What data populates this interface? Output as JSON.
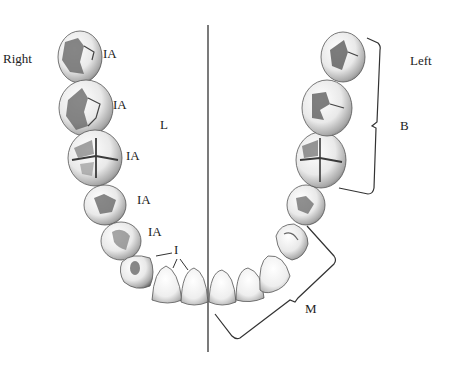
{
  "figure": {
    "type": "mandibular dental arch, occlusal view",
    "background": "#ffffff",
    "ink_color": "#222222"
  },
  "labels": {
    "right": "Right",
    "left": "Left",
    "lingual": "L",
    "buccal_bracket": "B",
    "mesial_bracket": "M",
    "incisors": "I",
    "ia": [
      "IA",
      "IA",
      "IA",
      "IA",
      "IA"
    ]
  },
  "midline": {
    "x": 208,
    "y_top": 25,
    "y_bottom": 352
  },
  "teeth": {
    "right_side": [
      {
        "name": "right-third-molar",
        "cx": 80,
        "cy": 57,
        "rx": 22,
        "ry": 26
      },
      {
        "name": "right-second-molar",
        "cx": 86,
        "cy": 108,
        "rx": 27,
        "ry": 28
      },
      {
        "name": "right-first-molar",
        "cx": 95,
        "cy": 158,
        "rx": 27,
        "ry": 28
      },
      {
        "name": "right-second-premolar",
        "cx": 105,
        "cy": 205,
        "rx": 21,
        "ry": 20
      },
      {
        "name": "right-first-premolar",
        "cx": 121,
        "cy": 241,
        "rx": 20,
        "ry": 19
      },
      {
        "name": "right-canine",
        "cx": 137,
        "cy": 273,
        "rx": 17,
        "ry": 19
      },
      {
        "name": "right-lateral-incisor",
        "cx": 167,
        "cy": 285,
        "rx": 15,
        "ry": 19
      },
      {
        "name": "right-central-incisor",
        "cx": 194,
        "cy": 288,
        "rx": 13,
        "ry": 19
      }
    ],
    "left_side": [
      {
        "name": "left-central-incisor",
        "cx": 222,
        "cy": 289,
        "rx": 13,
        "ry": 19
      },
      {
        "name": "left-lateral-incisor",
        "cx": 250,
        "cy": 284,
        "rx": 14,
        "ry": 19
      },
      {
        "name": "left-canine",
        "cx": 274,
        "cy": 269,
        "rx": 15,
        "ry": 20
      },
      {
        "name": "left-first-premolar",
        "cx": 292,
        "cy": 242,
        "rx": 18,
        "ry": 19
      },
      {
        "name": "left-second-premolar",
        "cx": 306,
        "cy": 205,
        "rx": 19,
        "ry": 20
      },
      {
        "name": "left-first-molar",
        "cx": 321,
        "cy": 160,
        "rx": 25,
        "ry": 28
      },
      {
        "name": "left-second-molar",
        "cx": 327,
        "cy": 108,
        "rx": 25,
        "ry": 28
      },
      {
        "name": "left-third-molar",
        "cx": 343,
        "cy": 57,
        "rx": 22,
        "ry": 25
      }
    ]
  }
}
